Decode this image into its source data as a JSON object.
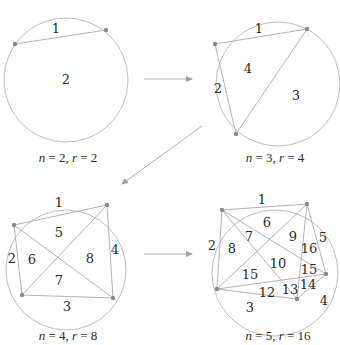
{
  "diagrams": [
    {
      "name": "n2",
      "caption": {
        "n": "2",
        "r": "2"
      },
      "circle": {
        "cx": 66,
        "cy": 80,
        "r": 62
      },
      "points": [
        [
          15,
          44
        ],
        [
          106,
          30
        ]
      ],
      "chords": [
        [
          0,
          1
        ]
      ],
      "regions": [
        {
          "label": "1",
          "x": 56,
          "y": 28
        },
        {
          "label": "2",
          "x": 66,
          "y": 79
        }
      ],
      "caption_pos": {
        "x": 68,
        "y": 162
      }
    },
    {
      "name": "n3",
      "caption": {
        "n": "3",
        "r": "4"
      },
      "circle": {
        "cx": 278,
        "cy": 84,
        "r": 62
      },
      "points": [
        [
          215,
          44
        ],
        [
          307,
          29
        ],
        [
          236,
          134
        ]
      ],
      "chords": [
        [
          0,
          1
        ],
        [
          1,
          2
        ],
        [
          2,
          0
        ]
      ],
      "regions": [
        {
          "label": "1",
          "x": 259,
          "y": 28
        },
        {
          "label": "2",
          "x": 218,
          "y": 88
        },
        {
          "label": "4",
          "x": 248,
          "y": 68
        },
        {
          "label": "3",
          "x": 296,
          "y": 95
        }
      ],
      "caption_pos": {
        "x": 275,
        "y": 162
      }
    },
    {
      "name": "n4",
      "caption": {
        "n": "4",
        "r": "8"
      },
      "circle": {
        "cx": 66,
        "cy": 270,
        "r": 60
      },
      "points": [
        [
          14,
          225
        ],
        [
          107,
          205
        ],
        [
          113,
          298
        ],
        [
          22,
          295
        ]
      ],
      "chords": [
        [
          0,
          1
        ],
        [
          1,
          2
        ],
        [
          2,
          3
        ],
        [
          3,
          0
        ],
        [
          0,
          2
        ],
        [
          1,
          3
        ]
      ],
      "regions": [
        {
          "label": "1",
          "x": 59,
          "y": 202
        },
        {
          "label": "2",
          "x": 12,
          "y": 258
        },
        {
          "label": "6",
          "x": 32,
          "y": 259
        },
        {
          "label": "5",
          "x": 59,
          "y": 232
        },
        {
          "label": "8",
          "x": 90,
          "y": 258
        },
        {
          "label": "4",
          "x": 115,
          "y": 249
        },
        {
          "label": "7",
          "x": 59,
          "y": 280
        },
        {
          "label": "3",
          "x": 67,
          "y": 306
        }
      ],
      "caption_pos": {
        "x": 68,
        "y": 340
      }
    },
    {
      "name": "n5",
      "caption": {
        "n": "5",
        "r": "16"
      },
      "circle": {
        "cx": 275,
        "cy": 273,
        "r": 63
      },
      "points": [
        [
          222,
          210
        ],
        [
          307,
          204
        ],
        [
          326,
          274
        ],
        [
          297,
          299
        ],
        [
          217,
          289
        ]
      ],
      "chords": [
        [
          0,
          1
        ],
        [
          1,
          2
        ],
        [
          2,
          3
        ],
        [
          3,
          4
        ],
        [
          4,
          0
        ],
        [
          0,
          2
        ],
        [
          0,
          3
        ],
        [
          1,
          3
        ],
        [
          1,
          4
        ],
        [
          2,
          4
        ]
      ],
      "regions": [
        {
          "label": "1",
          "x": 262,
          "y": 199
        },
        {
          "label": "6",
          "x": 267,
          "y": 222
        },
        {
          "label": "7",
          "x": 249,
          "y": 236
        },
        {
          "label": "9",
          "x": 293,
          "y": 236
        },
        {
          "label": "5",
          "x": 323,
          "y": 237
        },
        {
          "label": "2",
          "x": 212,
          "y": 245
        },
        {
          "label": "8",
          "x": 232,
          "y": 248
        },
        {
          "label": "16",
          "x": 309,
          "y": 248
        },
        {
          "label": "10",
          "x": 278,
          "y": 263
        },
        {
          "label": "15",
          "x": 250,
          "y": 274
        },
        {
          "label": "15",
          "x": 309,
          "y": 269
        },
        {
          "label": "14",
          "x": 308,
          "y": 284
        },
        {
          "label": "12",
          "x": 267,
          "y": 292
        },
        {
          "label": "13",
          "x": 290,
          "y": 289
        },
        {
          "label": "4",
          "x": 324,
          "y": 300
        },
        {
          "label": "3",
          "x": 250,
          "y": 307
        }
      ],
      "caption_pos": {
        "x": 278,
        "y": 340
      }
    }
  ],
  "arrows": [
    {
      "name": "arrow-n2-to-n3",
      "x1": 144,
      "y1": 79,
      "x2": 192,
      "y2": 79
    },
    {
      "name": "arrow-n3-to-n4",
      "x1": 202,
      "y1": 126,
      "x2": 122,
      "y2": 184
    },
    {
      "name": "arrow-n4-to-n5",
      "x1": 144,
      "y1": 254,
      "x2": 192,
      "y2": 254
    }
  ],
  "caption_template": {
    "n_var": "n",
    "r_var": "r",
    "eq": " = ",
    "sep": ", "
  }
}
